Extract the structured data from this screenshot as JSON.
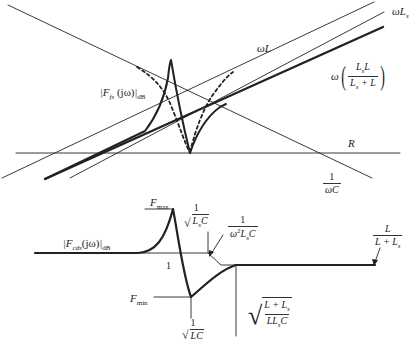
{
  "top_diagram": {
    "curve_label": {
      "symbol": "F",
      "subscript": "fs",
      "argument": "(jω)",
      "suffix": "dB"
    },
    "line_labels": {
      "omega_L": "ωL",
      "omega_Ls": "ωL",
      "omega_Ls_sub": "s",
      "parallel_prefix": "ω",
      "parallel_num": "L",
      "parallel_num_sub": "s",
      "parallel_num_tail": "L",
      "parallel_den": "L",
      "parallel_den_sub": "s",
      "parallel_den_tail": " + L",
      "R": "R",
      "inv_omega_C_num": "1",
      "inv_omega_C_den": "ωC"
    }
  },
  "bottom_diagram": {
    "curve_label": {
      "symbol": "F",
      "subscript": "cds",
      "argument": "(jω)",
      "suffix": "dB"
    },
    "labels": {
      "fmax": "F",
      "fmax_sub": "max",
      "fmin": "F",
      "fmin_sub": "min",
      "one": "1",
      "res_Ls_num": "1",
      "res_Ls_den": "L",
      "res_Ls_den_sub": "s",
      "res_Ls_den_tail": "C",
      "asym_num": "1",
      "asym_den_a": "ω",
      "asym_den_sup": "2",
      "asym_den_b": "L",
      "asym_den_sub": "s",
      "asym_den_c": "C",
      "res_LC_num": "1",
      "res_LC_den": "LC",
      "res_par_num_a": "L + L",
      "res_par_num_sub": "s",
      "res_par_den_a": "LL",
      "res_par_den_sub": "s",
      "res_par_den_c": "C",
      "hf_num": "L",
      "hf_den_a": "L + L",
      "hf_den_sub": "s"
    }
  },
  "colors": {
    "ink": "#222222",
    "background": "#ffffff"
  }
}
